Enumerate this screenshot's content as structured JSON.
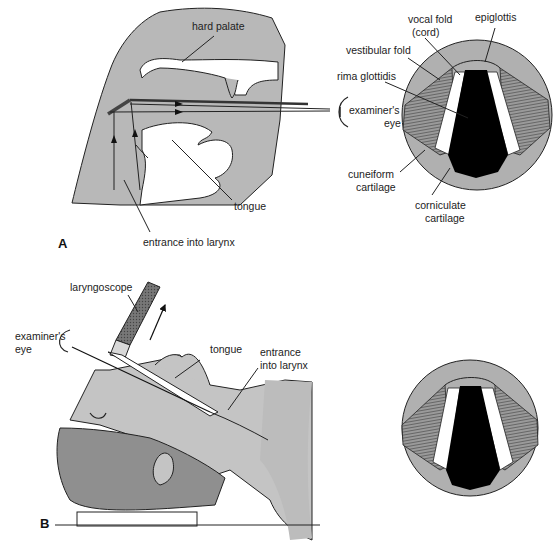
{
  "figure": {
    "panel_a": {
      "letter": "A",
      "labels": {
        "hard_palate": "hard palate",
        "tongue": "tongue",
        "entrance": "entrance into larynx",
        "examiner_eye_1": "examiner's",
        "examiner_eye_2": "eye",
        "vocal_fold_1": "vocal fold",
        "vocal_fold_2": "(cord)",
        "epiglottis": "epiglottis",
        "vestibular_fold": "vestibular fold",
        "rima_glottidis": "rima glottidis",
        "cuneiform_1": "cuneiform",
        "cuneiform_2": "cartilage",
        "corniculate_1": "corniculate",
        "corniculate_2": "cartilage"
      }
    },
    "panel_b": {
      "letter": "B",
      "labels": {
        "laryngoscope": "laryngoscope",
        "examiner_eye_1": "examiner's",
        "examiner_eye_2": "eye",
        "tongue": "tongue",
        "entrance_1": "entrance",
        "entrance_2": "into larynx"
      }
    },
    "colors": {
      "tissue": "#b8b8b8",
      "tissue_light": "#c8c8c8",
      "hair": "#8f8f8f",
      "glottis": "#000000",
      "line": "#222222"
    }
  }
}
